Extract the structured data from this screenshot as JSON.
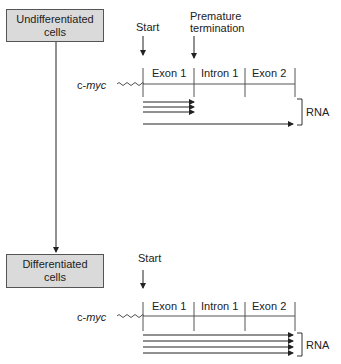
{
  "top_panel": {
    "cell_label_line1": "Undifferentiated",
    "cell_label_line2": "cells",
    "start_label": "Start",
    "termination_label_line1": "Premature",
    "termination_label_line2": "termination",
    "gene_prefix": "c-",
    "gene_name": "myc",
    "segments": [
      "Exon 1",
      "Intron 1",
      "Exon 2"
    ],
    "rna_label": "RNA",
    "transcripts": {
      "short_count": 3,
      "full_length_count": 1
    }
  },
  "bottom_panel": {
    "cell_label_line1": "Differentiated",
    "cell_label_line2": "cells",
    "start_label": "Start",
    "gene_prefix": "c-",
    "gene_name": "myc",
    "segments": [
      "Exon 1",
      "Intron 1",
      "Exon 2"
    ],
    "rna_label": "RNA",
    "transcripts": {
      "short_count": 0,
      "full_length_count": 4
    }
  },
  "colors": {
    "box_fill": "#dadada",
    "line": "#222222"
  }
}
